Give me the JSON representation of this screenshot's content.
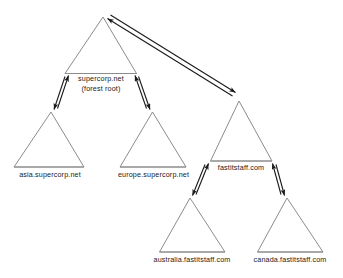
{
  "diagram": {
    "type": "active-directory-forest-trust-tree",
    "background_color": "#ffffff",
    "triangle_stroke_color": "#8c8c8c",
    "trust_arrow_color": "#1a1a1a",
    "label_color": "#1a1a1a",
    "domains": [
      {
        "id": "forest-root",
        "label_line1": "supercorp.net",
        "label_line2": "(forest root)"
      },
      {
        "id": "asia",
        "label": "asia.supercorp.net"
      },
      {
        "id": "europe",
        "label": "europe.supercorp.net"
      },
      {
        "id": "fastitstaff",
        "label": "fastitstaff.com"
      },
      {
        "id": "australia",
        "label": "australia.fastitstaff.com"
      },
      {
        "id": "canada",
        "label": "canada.fastitstaff.com"
      }
    ],
    "trusts": [
      {
        "id": "trust-root-asia",
        "from": "forest-root",
        "to": "asia",
        "style": "two-way"
      },
      {
        "id": "trust-root-europe",
        "from": "forest-root",
        "to": "europe",
        "style": "two-way"
      },
      {
        "id": "trust-root-fastitstaff",
        "from": "forest-root",
        "to": "fastitstaff",
        "style": "two-way"
      },
      {
        "id": "trust-fastitstaff-australia",
        "from": "fastitstaff",
        "to": "australia",
        "style": "two-way"
      },
      {
        "id": "trust-fastitstaff-canada",
        "from": "fastitstaff",
        "to": "canada",
        "style": "two-way"
      }
    ]
  }
}
